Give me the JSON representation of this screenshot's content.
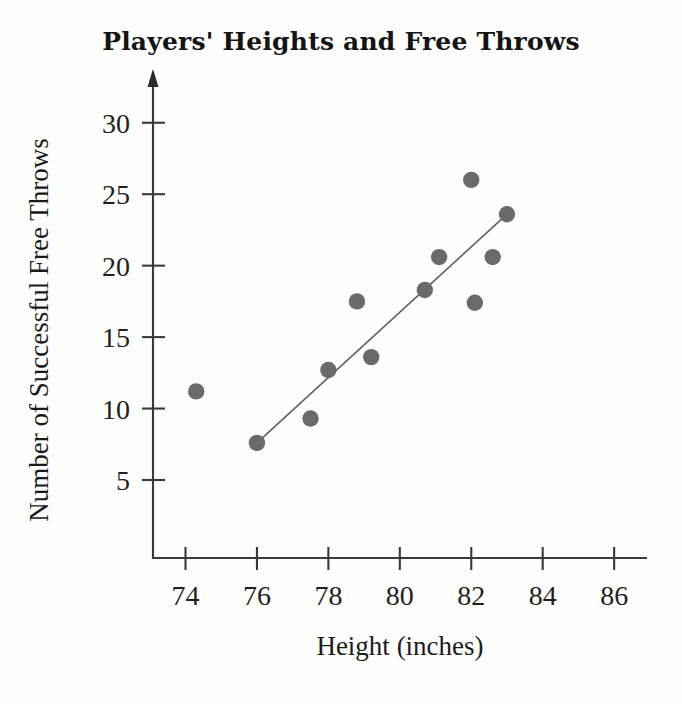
{
  "chart_data": {
    "type": "scatter",
    "title": "Players' Heights and Free Throws",
    "xlabel": "Height (inches)",
    "ylabel": "Number of Successful Free Throws",
    "xlim": [
      73.0,
      87.2
    ],
    "ylim": [
      0.0,
      32.0
    ],
    "grid": false,
    "legend": null,
    "xticks": [
      74,
      76,
      78,
      80,
      82,
      84,
      86
    ],
    "xtick_labels": [
      "74",
      "76",
      "78",
      "80",
      "82",
      "84",
      "86"
    ],
    "yticks": [
      5,
      10,
      15,
      20,
      25,
      30
    ],
    "ytick_labels": [
      "5",
      "10",
      "15",
      "20",
      "25",
      "30"
    ],
    "marker_color": "#6a6a6a",
    "line_color": "#606060",
    "axis_color": "#3a3a3a",
    "points": [
      {
        "x": 74.3,
        "y": 11.2
      },
      {
        "x": 76.0,
        "y": 7.6
      },
      {
        "x": 77.5,
        "y": 9.3
      },
      {
        "x": 78.0,
        "y": 12.7
      },
      {
        "x": 78.8,
        "y": 17.5
      },
      {
        "x": 79.2,
        "y": 13.6
      },
      {
        "x": 80.7,
        "y": 18.3
      },
      {
        "x": 81.1,
        "y": 20.6
      },
      {
        "x": 82.0,
        "y": 26.0
      },
      {
        "x": 82.1,
        "y": 17.4
      },
      {
        "x": 82.6,
        "y": 20.6
      },
      {
        "x": 83.0,
        "y": 23.6
      }
    ],
    "trend_line": {
      "name": "line of best fit",
      "x0": 76.0,
      "y0": 7.6,
      "x1": 83.0,
      "y1": 23.6
    }
  }
}
